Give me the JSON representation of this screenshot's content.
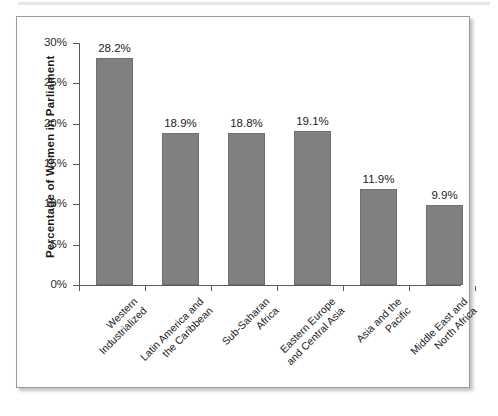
{
  "figure": {
    "background_color": "#ffffff",
    "frame_color": "#9a9a9a",
    "bar_color": "#808080",
    "axis_color": "#5a5a5a",
    "text_color": "#1c1c1c"
  },
  "chart_data": {
    "type": "bar",
    "title": "",
    "xlabel": "",
    "ylabel": "Percentage of  Women in Parliament",
    "ylim": [
      0,
      30
    ],
    "grid": false,
    "legend": null,
    "categories": [
      "Western Industrialized",
      "Latin America and the Caribbean",
      "Sub-Saharan Africa",
      "Eastern Europe and Central Asia",
      "Asia and the Pacific",
      "Middle East and North Africa"
    ],
    "category_lines": [
      [
        "Western",
        "Industrialized"
      ],
      [
        "Latin America and",
        "the Caribbean"
      ],
      [
        "Sub-Saharan",
        "Africa"
      ],
      [
        "Eastern Europe",
        "and Central Asia"
      ],
      [
        "Asia and the",
        "Pacific"
      ],
      [
        "Middle East and",
        "North Africa"
      ]
    ],
    "values": [
      28.2,
      18.9,
      18.8,
      19.1,
      11.9,
      9.9
    ],
    "value_labels": [
      "28.2%",
      "18.9%",
      "18.8%",
      "19.1%",
      "11.9%",
      "9.9%"
    ],
    "ytick_values": [
      0,
      5,
      10,
      15,
      20,
      25,
      30
    ],
    "ytick_labels": [
      "0%",
      "5%",
      "10%",
      "15%",
      "20%",
      "25%",
      "30%"
    ]
  }
}
